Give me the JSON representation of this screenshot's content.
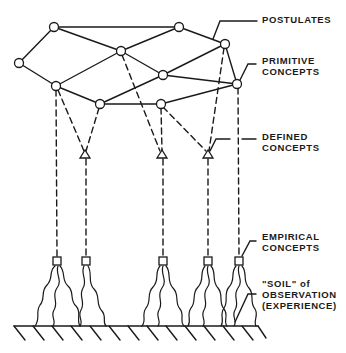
{
  "diagram": {
    "labels": {
      "postulates": "POSTULATES",
      "primitive_line1": "PRIMITIVE",
      "primitive_line2": "CONCEPTS",
      "defined_line1": "DEFINED",
      "defined_line2": "CONCEPTS",
      "empirical_line1": "EMPIRICAL",
      "empirical_line2": "CONCEPTS",
      "soil_line1": "\"SOIL\" of",
      "soil_line2": "OBSERVATION",
      "soil_line3": "(EXPERIENCE)"
    },
    "primitive_nodes": [
      {
        "id": "A",
        "x": 54,
        "y": 27
      },
      {
        "id": "B",
        "x": 179,
        "y": 27
      },
      {
        "id": "C",
        "x": 19,
        "y": 63
      },
      {
        "id": "D",
        "x": 121,
        "y": 51
      },
      {
        "id": "E",
        "x": 225,
        "y": 44
      },
      {
        "id": "F",
        "x": 163,
        "y": 75
      },
      {
        "id": "G",
        "x": 56,
        "y": 86
      },
      {
        "id": "H",
        "x": 100,
        "y": 104
      },
      {
        "id": "I",
        "x": 161,
        "y": 104
      },
      {
        "id": "J",
        "x": 237,
        "y": 84
      }
    ],
    "defined_nodes": [
      {
        "id": "T1",
        "x": 85,
        "y": 155
      },
      {
        "id": "T2",
        "x": 162,
        "y": 155
      },
      {
        "id": "T3",
        "x": 208,
        "y": 155
      }
    ],
    "empirical_nodes": [
      {
        "id": "S1",
        "x": 57,
        "y": 261
      },
      {
        "id": "S2",
        "x": 86,
        "y": 261
      },
      {
        "id": "S3",
        "x": 163,
        "y": 261
      },
      {
        "id": "S4",
        "x": 208,
        "y": 261
      },
      {
        "id": "S5",
        "x": 239,
        "y": 261
      }
    ],
    "colors": {
      "ink": "#1a1a1a",
      "background": "#ffffff"
    }
  }
}
